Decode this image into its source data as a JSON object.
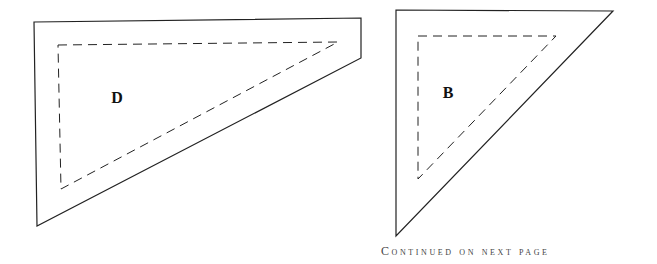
{
  "page": {
    "background": "#ffffff",
    "line_color": "#222222"
  },
  "pieces": [
    {
      "id": "D",
      "label": "D",
      "outer_points": "34,22 361,18 361,58 37,226",
      "inner_points": "58,45 338,42 61,189",
      "label_pos": {
        "x": 117,
        "y": 98
      }
    },
    {
      "id": "B",
      "label": "B",
      "outer_points": "396,10 613,11 396,236",
      "inner_points": "418,36 556,36 418,179",
      "label_pos": {
        "x": 448,
        "y": 93
      }
    }
  ],
  "footer": {
    "text": "Continued on next page"
  }
}
